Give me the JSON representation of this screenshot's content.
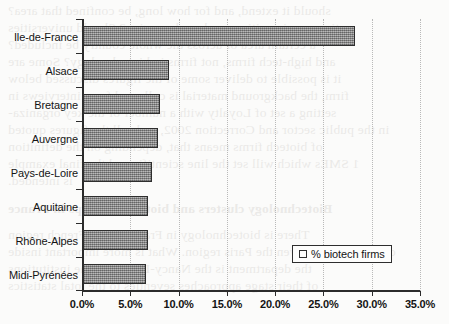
{
  "chart_data": {
    "type": "bar",
    "orientation": "horizontal",
    "title": "",
    "xlabel": "",
    "ylabel": "",
    "categories": [
      "Ile-de-France",
      "Alsace",
      "Bretagne",
      "Auvergne",
      "Pays-de-Loire",
      "Aquitaine",
      "Rhône-Alpes",
      "Midi-Pyrénées"
    ],
    "values": [
      28.2,
      8.9,
      8.0,
      7.8,
      7.2,
      6.8,
      6.7,
      6.5
    ],
    "series": [
      {
        "name": "% biotech firms",
        "values": [
          28.2,
          8.9,
          8.0,
          7.8,
          7.2,
          6.8,
          6.7,
          6.5
        ]
      }
    ],
    "xlim": [
      0,
      35
    ],
    "x_tick_values": [
      0,
      5,
      10,
      15,
      20,
      25,
      30,
      35
    ],
    "x_tick_labels": [
      "0.0%",
      "5.0%",
      "10.0%",
      "15.0%",
      "20.0%",
      "25.0%",
      "30.0%",
      "35.0%"
    ],
    "grid": true,
    "grid_axis": "x",
    "legend": [
      "% biotech firms"
    ],
    "legend_position": "inside-lower-right",
    "units": "percent",
    "colors": {
      "bar_fill": "#9a9a9a",
      "bar_border": "#2e2e2e",
      "axis": "#2b2b2b",
      "grid": "#b9b9b9",
      "background": "#fbfbfa",
      "text": "#141414"
    }
  },
  "legend": {
    "marker": "legend-swatch",
    "label": "% biotech firms"
  },
  "bleed_text": {
    "lines": [
      "should it extend, and for how long, be confined that area?",
      "ties or universities or a broader region? Should universities",
      "a certain area or across the whole country be included?",
      "and high-tech firms, not firms in biotechnology? Some are",
      "it is possible to deliver some of the figures discussed below",
      "firm, the background material is collected from interviews in",
      "setting a set of Loyalty with a number of the key organiza-",
      "in the public sector and Correction 2002, and call the figures quoted",
      "of biotech firms means that, depending on the definition",
      "1 SMEs which will set the line scientific and the final example",
      "is intended.",
      "Biotechnology clusters and biotech start-ups in France",
      "There is biotechnology in France in the French region",
      "cluster, and are given the Paris region. What is more important inside",
      "the department is the Nancy-Dijon and the institutions",
      "of their stage approaches seventies to the total statistics"
    ]
  }
}
